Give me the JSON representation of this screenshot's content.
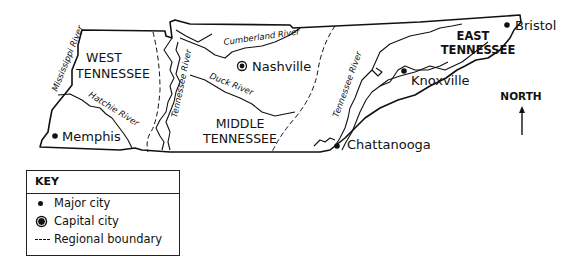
{
  "map": {
    "regions": [
      {
        "name": "WEST",
        "name2": "TENNESSEE"
      },
      {
        "name": "MIDDLE",
        "name2": "TENNESSEE"
      },
      {
        "name": "EAST",
        "name2": "TENNESSEE"
      }
    ],
    "cities": [
      {
        "name": "Memphis",
        "type": "major"
      },
      {
        "name": "Nashville",
        "type": "capital"
      },
      {
        "name": "Knoxville",
        "type": "major"
      },
      {
        "name": "Chattanooga",
        "type": "major"
      },
      {
        "name": "Bristol",
        "type": "major"
      }
    ],
    "rivers": [
      {
        "name": "Mississippi River"
      },
      {
        "name": "Hatchie River"
      },
      {
        "name": "Tennessee River"
      },
      {
        "name": "Cumberland River"
      },
      {
        "name": "Duck River"
      },
      {
        "name": "Tennessee River"
      }
    ],
    "compass": {
      "label": "NORTH"
    }
  },
  "key": {
    "title": "KEY",
    "items": [
      {
        "symbol": "dot",
        "label": "Major city"
      },
      {
        "symbol": "circled-dot",
        "label": "Capital city"
      },
      {
        "symbol": "dashed-line",
        "label": "Regional boundary"
      }
    ]
  }
}
